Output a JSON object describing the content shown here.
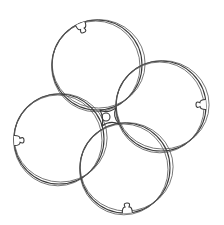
{
  "figure": {
    "stroke_color": "#3a3a3a",
    "background_color": "#ffffff",
    "hub": {
      "cx": 106,
      "cy": 117,
      "r": 4
    },
    "discs": [
      {
        "name": "top",
        "cx": 97,
        "cy": 65,
        "r": 45,
        "notch_angle_deg": -112
      },
      {
        "name": "right",
        "cx": 161,
        "cy": 106,
        "r": 45,
        "notch_angle_deg": -2
      },
      {
        "name": "left",
        "cx": 59,
        "cy": 139,
        "r": 45,
        "notch_angle_deg": 178
      },
      {
        "name": "bottom",
        "cx": 125,
        "cy": 168,
        "r": 45,
        "notch_angle_deg": 87
      }
    ]
  }
}
